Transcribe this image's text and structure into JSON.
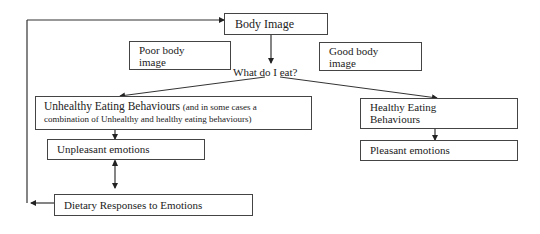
{
  "diagram": {
    "nodes": {
      "body_image": "Body Image",
      "poor_body_image_line1": "Poor body",
      "poor_body_image_line2": "image",
      "good_body_image_line1": "Good body",
      "good_body_image_line2": "image",
      "decision": "What do I eat?",
      "unhealthy_title": "Unhealthy Eating Behaviours",
      "unhealthy_note_line1": "(and in some cases a",
      "unhealthy_note_line2": "combination of Unhealthy and healthy eating behaviours)",
      "healthy_line1": "Healthy Eating",
      "healthy_line2": "Behaviours",
      "unpleasant": "Unpleasant emotions",
      "pleasant": "Pleasant emotions",
      "dietary": "Dietary Responses to Emotions"
    },
    "edges": [
      {
        "from": "Body Image",
        "to": "What do I eat?"
      },
      {
        "from": "What do I eat?",
        "to": "Unhealthy Eating Behaviours"
      },
      {
        "from": "What do I eat?",
        "to": "Healthy Eating Behaviours"
      },
      {
        "from": "Unhealthy Eating Behaviours",
        "to": "Unpleasant emotions"
      },
      {
        "from": "Healthy Eating Behaviours",
        "to": "Pleasant emotions"
      },
      {
        "from": "Unpleasant emotions",
        "to": "Dietary Responses to Emotions",
        "bidirectional": true
      },
      {
        "from": "Dietary Responses to Emotions",
        "to": "Body Image",
        "type": "feedback-loop"
      }
    ]
  }
}
